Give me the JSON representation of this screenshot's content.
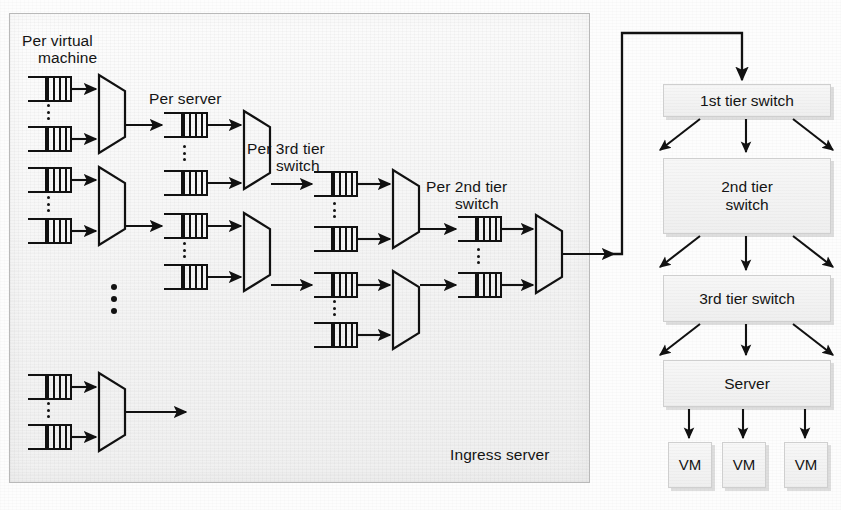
{
  "figure": {
    "type": "queueing-network-diagram",
    "left_panel_label": "Ingress server",
    "caption_partial": ""
  },
  "left_panel": {
    "name": "Ingress server",
    "stage_labels": [
      {
        "id": "vm",
        "text": "Per virtual\nmachine"
      },
      {
        "id": "server",
        "text": "Per server"
      },
      {
        "id": "tier3",
        "text": "Per 3rd tier\nswitch"
      },
      {
        "id": "tier2",
        "text": "Per 2nd tier\nswitch"
      }
    ],
    "label_vm_line1": "Per virtual",
    "label_vm_line2": "machine",
    "label_server": "Per server",
    "label_tier3_line1": "Per 3rd tier",
    "label_tier3_line2": "switch",
    "label_tier2_line1": "Per 2nd tier",
    "label_tier2_line2": "switch",
    "label_ingress": "Ingress server",
    "queue_symbol_name": "queue-fifo-icon",
    "mux_symbol_name": "multiplexer-icon",
    "ellipsis_symbol_name": "vertical-ellipsis-icon"
  },
  "right_panel": {
    "nodes": [
      {
        "id": "tier1",
        "label": "1st tier switch"
      },
      {
        "id": "tier2",
        "label": "2nd tier\nswitch",
        "line1": "2nd tier",
        "line2": "switch"
      },
      {
        "id": "tier3",
        "label": "3rd tier switch"
      },
      {
        "id": "server",
        "label": "Server"
      }
    ],
    "tier1_label": "1st tier switch",
    "tier2_label_line1": "2nd tier",
    "tier2_label_line2": "switch",
    "tier3_label": "3rd tier switch",
    "server_label": "Server",
    "vms": [
      {
        "label": "VM"
      },
      {
        "label": "VM"
      },
      {
        "label": "VM"
      }
    ],
    "vm_label": "VM"
  },
  "colors": {
    "ink": "#111111",
    "panel_fill": "#f4f4f4",
    "panel_border": "#b9b9b9",
    "box_fill": "#f2f2f2",
    "box_border": "#cfcfcf",
    "shadow": "rgba(0,0,0,0.12)",
    "page": "#ffffff"
  }
}
